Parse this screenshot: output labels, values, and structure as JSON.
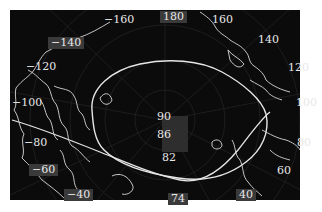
{
  "map": {
    "projection": "north-polar-stereographic",
    "background_color": "#0b0b0b",
    "line_color": "#e6e6e6",
    "longitude_labels": [
      {
        "id": "lon-m160",
        "text": "−160",
        "x": 104,
        "y": 16
      },
      {
        "id": "lon-180",
        "text": "180",
        "x": 163,
        "y": 12
      },
      {
        "id": "lon-160",
        "text": "160",
        "x": 212,
        "y": 16
      },
      {
        "id": "lon-140",
        "text": "140",
        "x": 257,
        "y": 35
      },
      {
        "id": "lon-120",
        "text": "120",
        "x": 289,
        "y": 63
      },
      {
        "id": "lon-100",
        "text": "100",
        "x": 296,
        "y": 97
      },
      {
        "id": "lon-80",
        "text": "80",
        "x": 297,
        "y": 137
      },
      {
        "id": "lon-60",
        "text": "60",
        "x": 277,
        "y": 166
      },
      {
        "id": "lon-40",
        "text": "40",
        "x": 240,
        "y": 190
      },
      {
        "id": "lon-m40",
        "text": "−40",
        "x": 66,
        "y": 189
      },
      {
        "id": "lon-m60",
        "text": "−60",
        "x": 31,
        "y": 165
      },
      {
        "id": "lon-m80",
        "text": "−80",
        "x": 24,
        "y": 137
      },
      {
        "id": "lon-m100",
        "text": "−100",
        "x": 12,
        "y": 98
      },
      {
        "id": "lon-m120",
        "text": "−120",
        "x": 26,
        "y": 62
      },
      {
        "id": "lon-m140",
        "text": "−140",
        "x": 50,
        "y": 38
      }
    ],
    "latitude_labels": [
      {
        "id": "lat-90",
        "text": "90",
        "x": 157,
        "y": 112
      },
      {
        "id": "lat-86",
        "text": "86",
        "x": 157,
        "y": 130
      },
      {
        "id": "lat-82",
        "text": "82",
        "x": 162,
        "y": 153
      },
      {
        "id": "lat-74",
        "text": "74",
        "x": 172,
        "y": 195
      }
    ]
  }
}
